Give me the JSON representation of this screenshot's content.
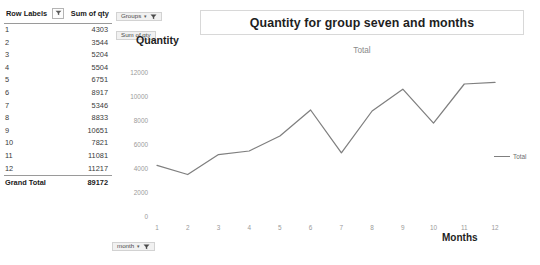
{
  "pivot_table": {
    "columns": [
      "Row Labels",
      "Sum of qty"
    ],
    "header_filter_icon": "filter-dropdown-icon",
    "rows": [
      {
        "label": "1",
        "value": "4303"
      },
      {
        "label": "2",
        "value": "3544"
      },
      {
        "label": "3",
        "value": "5204"
      },
      {
        "label": "4",
        "value": "5504"
      },
      {
        "label": "5",
        "value": "6751"
      },
      {
        "label": "6",
        "value": "8917"
      },
      {
        "label": "7",
        "value": "5346"
      },
      {
        "label": "8",
        "value": "8833"
      },
      {
        "label": "9",
        "value": "10651"
      },
      {
        "label": "10",
        "value": "7821"
      },
      {
        "label": "11",
        "value": "11081"
      },
      {
        "label": "12",
        "value": "11217"
      }
    ],
    "grand_total": {
      "label": "Grand Total",
      "value": "89172"
    }
  },
  "chart": {
    "title": "Quantity for group seven and months",
    "subtitle": "Total",
    "y_axis_title": "Quantity",
    "x_axis_title": "Months",
    "legend": {
      "label": "Total",
      "color": "#7f7f7f"
    },
    "field_buttons": [
      {
        "name": "Groups",
        "caret": "▾",
        "icon": "filter-funnel-icon"
      },
      {
        "name": "Sum of qty",
        "caret": "",
        "icon": ""
      },
      {
        "name": "month",
        "caret": "▾",
        "icon": "filter-funnel-icon"
      }
    ]
  },
  "chart_data": {
    "type": "line",
    "title": "Quantity for group seven and months",
    "subtitle": "Total",
    "xlabel": "Months",
    "ylabel": "Quantity",
    "categories": [
      "1",
      "2",
      "3",
      "4",
      "5",
      "6",
      "7",
      "8",
      "9",
      "10",
      "11",
      "12"
    ],
    "series": [
      {
        "name": "Total",
        "color": "#7f7f7f",
        "values": [
          4303,
          3544,
          5204,
          5504,
          6751,
          8917,
          5346,
          8833,
          10651,
          7821,
          11081,
          11217
        ]
      }
    ],
    "ylim": [
      0,
      12000
    ],
    "yticks": [
      0,
      2000,
      4000,
      6000,
      8000,
      10000,
      12000
    ],
    "ytick_labels": [
      "0",
      "2000",
      "4000",
      "6000",
      "8000",
      "10000",
      "12000"
    ],
    "xticks": [
      "1",
      "2",
      "3",
      "4",
      "5",
      "6",
      "7",
      "8",
      "9",
      "10",
      "11",
      "12"
    ],
    "grid": false,
    "legend_position": "right"
  }
}
